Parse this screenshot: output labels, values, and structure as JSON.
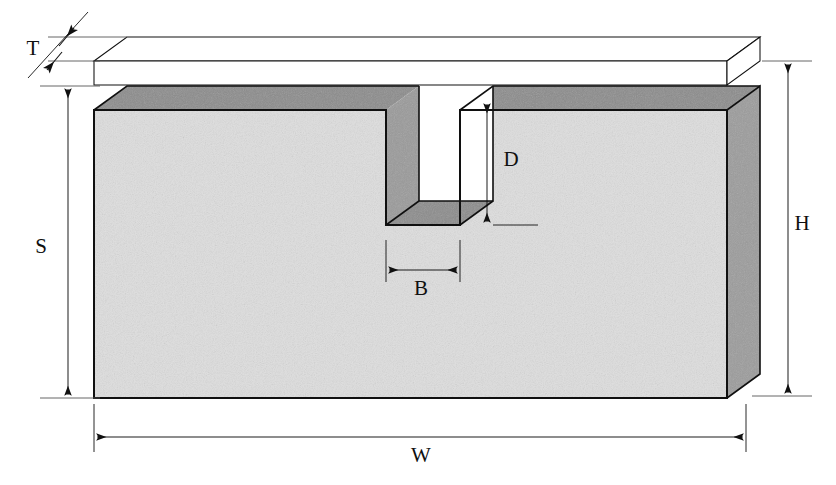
{
  "figure": {
    "projection": "isometric",
    "background_color": "#ffffff",
    "line_color": "#101010",
    "colors": {
      "front_face": "#dedede",
      "top_face": "#8c8c8c",
      "right_face": "#9c9c9c",
      "slot_wall": "#9a9a9a",
      "slot_floor": "#8c8c8c",
      "plate_fill": "#ffffff",
      "outline": "#101010",
      "dimension_line": "#1a1a1a"
    },
    "dimensions": [
      {
        "symbol": "T",
        "name": "plate-thickness",
        "meaning": "thickness of thin top plate",
        "orientation": "vertical-diagonal-leader",
        "label_x": 33,
        "label_y": 55
      },
      {
        "symbol": "S",
        "name": "block-side-height",
        "meaning": "height of block front face below top plate",
        "orientation": "vertical",
        "label_x": 41,
        "label_y": 253
      },
      {
        "symbol": "D",
        "name": "slot-depth",
        "meaning": "depth of slot from top surface to slot floor",
        "orientation": "vertical",
        "label_x": 511,
        "label_y": 166
      },
      {
        "symbol": "B",
        "name": "slot-width",
        "meaning": "width of slot",
        "orientation": "horizontal",
        "label_x": 421,
        "label_y": 295
      },
      {
        "symbol": "H",
        "name": "overall-height",
        "meaning": "overall height including top plate",
        "orientation": "vertical",
        "label_x": 802,
        "label_y": 230
      },
      {
        "symbol": "W",
        "name": "overall-width",
        "meaning": "overall width of block",
        "orientation": "horizontal",
        "label_x": 421,
        "label_y": 462
      }
    ]
  }
}
